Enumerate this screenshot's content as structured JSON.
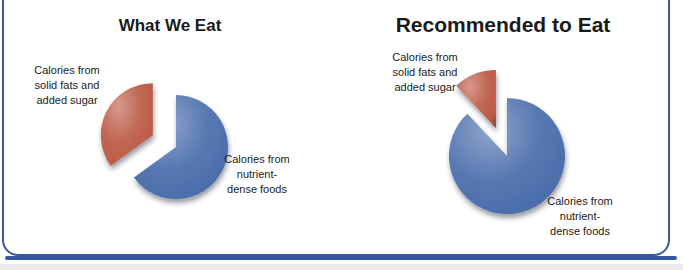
{
  "frame": {
    "accent_color": "#36589E",
    "background_color": "#FFFFFF"
  },
  "chart_data": [
    {
      "type": "pie",
      "title": "What We Eat",
      "direction": "clockwise",
      "start_angle_deg": 0,
      "legend": "none",
      "data_labels": "category-names",
      "slices": [
        {
          "id": "nutrient-dense",
          "label": "Calories from\nnutrient-\ndense foods",
          "category": "Calories from nutrient-dense foods",
          "value_pct": 65,
          "color": "#4A6DAB",
          "exploded": false
        },
        {
          "id": "solid-fats",
          "label": "Calories from\nsolid fats and\nadded sugar",
          "category": "Calories from solid fats and added sugar",
          "value_pct": 35,
          "color": "#BC5A45",
          "exploded": true
        }
      ]
    },
    {
      "type": "pie",
      "title": "Recommended to Eat",
      "direction": "clockwise",
      "start_angle_deg": 0,
      "legend": "none",
      "data_labels": "category-names",
      "slices": [
        {
          "id": "nutrient-dense",
          "label": "Calories from\nnutrient-\ndense foods",
          "category": "Calories from nutrient-dense foods",
          "value_pct": 88,
          "color": "#4A6DAB",
          "exploded": false
        },
        {
          "id": "solid-fats",
          "label": "Calories from\nsolid fats and\nadded sugar",
          "category": "Calories from solid fats and added sugar",
          "value_pct": 12,
          "color": "#BC5A45",
          "exploded": true
        }
      ]
    }
  ]
}
